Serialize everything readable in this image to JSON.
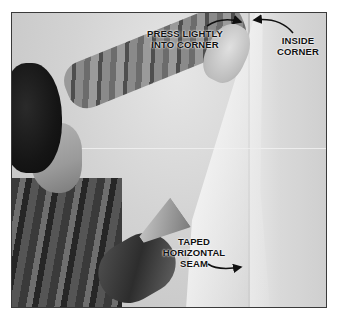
{
  "figure": {
    "labels": {
      "press": [
        "PRESS LIGHTLY",
        "INTO CORNER"
      ],
      "inside": [
        "INSIDE",
        "CORNER"
      ],
      "seam": [
        "TAPED",
        "HORIZONTAL",
        "SEAM"
      ]
    },
    "colors": {
      "border": "#3a3a3a",
      "label_text": "#111111",
      "background": "#ffffff"
    }
  }
}
